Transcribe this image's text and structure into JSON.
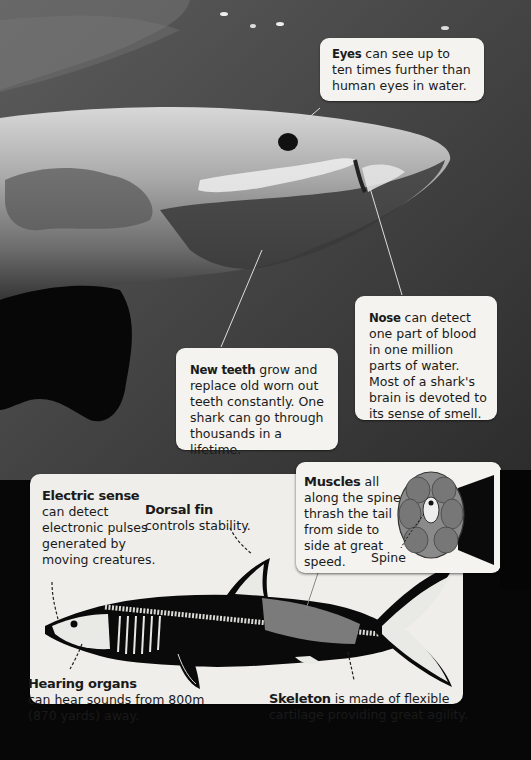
{
  "photo": {
    "subject": "Great white shark head underwater",
    "callouts": {
      "eyes": {
        "title": "Eyes",
        "text": "can see up to ten times further than human eyes in water."
      },
      "nose": {
        "title": "Nose",
        "text": "can detect one part of blood in one million parts of water. Most of a shark's brain is devoted to its sense of smell."
      },
      "new_teeth": {
        "title": "New teeth",
        "text": "grow and replace old worn out teeth constantly. One shark can go through thousands in a lifetime."
      }
    }
  },
  "diagram": {
    "labels": {
      "electric_sense": {
        "title": "Electric sense",
        "text": "can detect electronic pulses generated by moving creatures."
      },
      "dorsal_fin": {
        "title": "Dorsal fin",
        "text": "controls stability."
      },
      "muscles": {
        "title": "Muscles",
        "text": "all along the spine thrash the tail from side to side at great speed.",
        "sublabel": "Spine"
      },
      "hearing_organs": {
        "title": "Hearing organs",
        "text": "can hear sounds from 800m (870 yards) away."
      },
      "skeleton": {
        "title": "Skeleton",
        "text": "is made of flexible cartilage providing great agility."
      }
    }
  }
}
